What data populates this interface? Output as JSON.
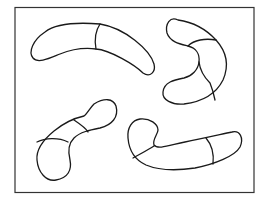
{
  "figure": {
    "line_color": "#1a1a1a",
    "frame_color": "#333333",
    "background": "#ffffff",
    "organisms": [
      {
        "name": "top-left-rod",
        "segments": 2
      },
      {
        "name": "top-right-c-shaped-rod",
        "segments": 3
      },
      {
        "name": "bottom-left-rod",
        "segments": 3
      },
      {
        "name": "bottom-right-hooked-rod",
        "segments": 3
      }
    ]
  }
}
